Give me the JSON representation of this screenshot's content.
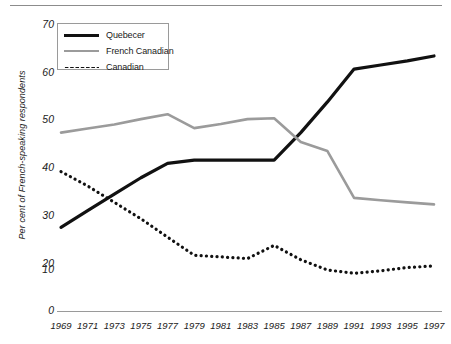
{
  "chart_data": {
    "type": "line",
    "title": "",
    "xlabel": "",
    "ylabel": "Per cent of French-speaking respondents",
    "x": [
      1969,
      1971,
      1973,
      1975,
      1977,
      1979,
      1981,
      1983,
      1985,
      1987,
      1989,
      1991,
      1993,
      1995,
      1997
    ],
    "categories": [
      "1969",
      "1971",
      "1973",
      "1975",
      "1977",
      "1979",
      "1981",
      "1983",
      "1985",
      "1987",
      "1989",
      "1991",
      "1993",
      "1995",
      "1997"
    ],
    "xlim": [
      1969,
      1997
    ],
    "ylim": [
      0,
      70
    ],
    "yticks": [
      0,
      10,
      20,
      30,
      40,
      50,
      60,
      70
    ],
    "ytick_labels": [
      "0",
      "10",
      "20",
      "30",
      "40",
      "50",
      "60",
      "70"
    ],
    "grid": false,
    "legend_position": "top-left",
    "series": [
      {
        "name": "Quebecer",
        "style": "solid",
        "color": "#111111",
        "width": 3.2,
        "values": [
          20.4,
          24.5,
          28.5,
          32.5,
          36.0,
          36.8,
          36.8,
          36.8,
          36.8,
          43.5,
          51.0,
          59.0,
          60.0,
          61.0,
          62.2
        ]
      },
      {
        "name": "French Canadian",
        "style": "solid",
        "color": "#9b9b9b",
        "width": 2.6,
        "values": [
          43.5,
          44.5,
          45.5,
          46.8,
          48.0,
          44.6,
          45.6,
          46.8,
          47.0,
          41.2,
          39.0,
          27.6,
          27.0,
          26.5,
          26.0
        ]
      },
      {
        "name": "Canadian",
        "style": "dotted",
        "color": "#111111",
        "width": 3.2,
        "values": [
          34.0,
          30.5,
          26.5,
          22.5,
          18.0,
          13.6,
          13.2,
          12.8,
          16.0,
          12.5,
          10.0,
          9.2,
          9.8,
          10.6,
          11.0
        ]
      }
    ],
    "annotations": {
      "gray_vertex_1984": {
        "x": 1984,
        "y": 48.0
      },
      "black_plateau_1979_1985": 36.8,
      "gray_drop_1990": 27.6
    }
  },
  "axis": {
    "ytick_labels": [
      "70",
      "60",
      "50",
      "40",
      "30",
      "20",
      "10",
      "0"
    ],
    "ylabel": "Per cent of French-speaking respondents",
    "xtick_labels": [
      "1969",
      "1971",
      "1973",
      "1975",
      "1977",
      "1979",
      "1981",
      "1983",
      "1985",
      "1987",
      "1989",
      "1991",
      "1993",
      "1995",
      "1997"
    ]
  },
  "legend": {
    "items": [
      {
        "label": "Quebecer",
        "icon": "solid-black-line-icon",
        "color": "#111111"
      },
      {
        "label": "French Canadian",
        "icon": "solid-gray-line-icon",
        "color": "#9b9b9b"
      },
      {
        "label": "Canadian",
        "icon": "dotted-black-line-icon",
        "color": "#111111"
      }
    ]
  },
  "colors": {
    "quebecer": "#111111",
    "french_canadian": "#9b9b9b",
    "canadian": "#111111",
    "axis": "#9a9a9a",
    "text": "#1a1a1a"
  }
}
